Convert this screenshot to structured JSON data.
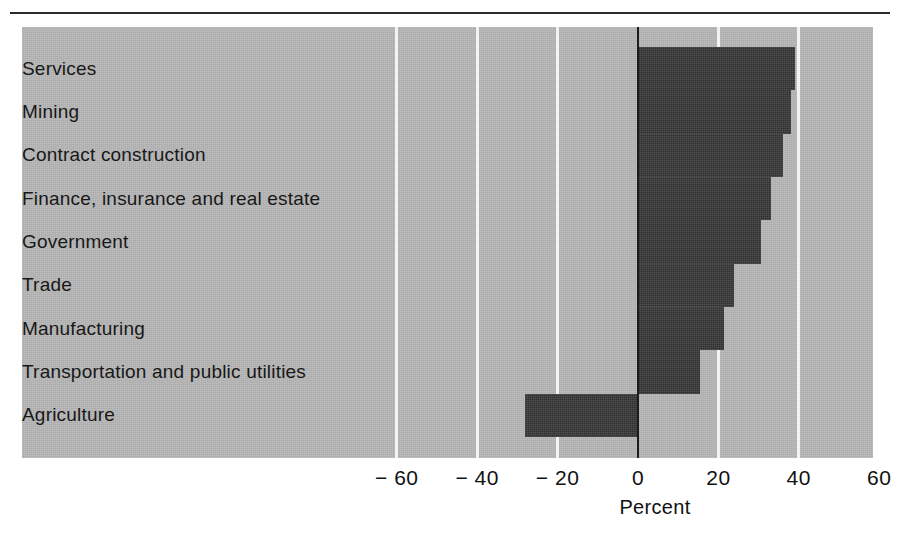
{
  "chart_data": {
    "type": "bar",
    "orientation": "horizontal",
    "title": "",
    "subtitle": "",
    "xlabel": "Percent",
    "ylabel": "",
    "categories": [
      "Services",
      "Mining",
      "Contract construction",
      "Finance, insurance and real estate",
      "Government",
      "Trade",
      "Manufacturing",
      "Transportation and public utilities",
      "Agriculture"
    ],
    "values": [
      39,
      38,
      36,
      33,
      30.5,
      24,
      21.5,
      15.5,
      -28
    ],
    "xlim": [
      -70,
      59
    ],
    "xticks": [
      -60,
      -40,
      -20,
      0,
      20,
      40,
      60
    ],
    "xtick_labels": [
      "− 60",
      "− 40",
      "− 20",
      "0",
      "20",
      "40",
      "60"
    ],
    "grid": "vertical",
    "legend": "none",
    "colors": {
      "panel_background": "#b7b7b7",
      "bar": "#3a3a3a",
      "gridline": "#f3f3f3",
      "zero_line": "#1d1d1d",
      "text": "#181818",
      "rule": "#2b2b2b"
    }
  },
  "axis": {
    "title": "Percent",
    "ticks": [
      {
        "label": "− 60",
        "value": -60
      },
      {
        "label": "− 40",
        "value": -40
      },
      {
        "label": "− 20",
        "value": -20
      },
      {
        "label": "0",
        "value": 0
      },
      {
        "label": "20",
        "value": 20
      },
      {
        "label": "40",
        "value": 40
      },
      {
        "label": "60",
        "value": 60
      }
    ]
  },
  "bars": [
    {
      "label": "Services",
      "value": 39
    },
    {
      "label": "Mining",
      "value": 38
    },
    {
      "label": "Contract construction",
      "value": 36
    },
    {
      "label": "Finance, insurance and real estate",
      "value": 33
    },
    {
      "label": "Government",
      "value": 30.5
    },
    {
      "label": "Trade",
      "value": 24
    },
    {
      "label": "Manufacturing",
      "value": 21.5
    },
    {
      "label": "Transportation and public utilities",
      "value": 15.5
    },
    {
      "label": "Agriculture",
      "value": -28
    }
  ]
}
